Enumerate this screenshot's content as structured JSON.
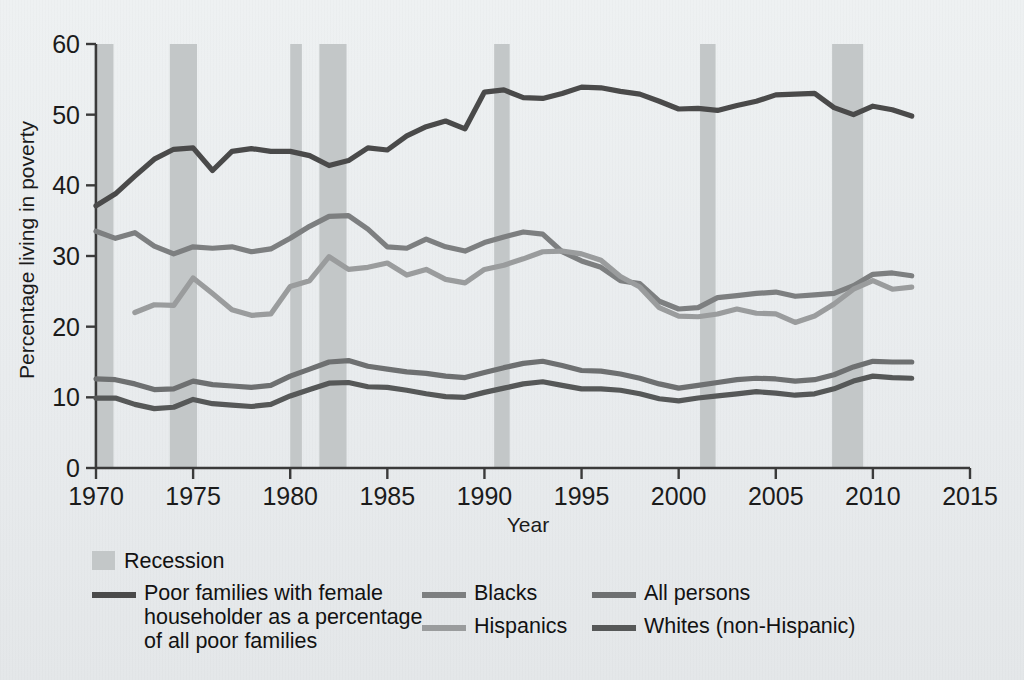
{
  "chart_data": {
    "type": "line",
    "title": "",
    "xlabel": "Year",
    "ylabel": "Percentage living in poverty",
    "xlim": [
      1970,
      2015
    ],
    "ylim": [
      0,
      60
    ],
    "xticks": [
      "1970",
      "1975",
      "1980",
      "1985",
      "1990",
      "1995",
      "2000",
      "2005",
      "2010",
      "2015"
    ],
    "yticks": [
      "0",
      "10",
      "20",
      "30",
      "40",
      "50",
      "60"
    ],
    "grid": false,
    "legend_position": "below-plot",
    "x": [
      1970,
      1971,
      1972,
      1973,
      1974,
      1975,
      1976,
      1977,
      1978,
      1979,
      1980,
      1981,
      1982,
      1983,
      1984,
      1985,
      1986,
      1987,
      1988,
      1989,
      1990,
      1991,
      1992,
      1993,
      1994,
      1995,
      1996,
      1997,
      1998,
      1999,
      2000,
      2001,
      2002,
      2003,
      2004,
      2005,
      2006,
      2007,
      2008,
      2009,
      2010,
      2011,
      2012
    ],
    "series": [
      {
        "name": "Poor families with female householder as a percentage of all poor families",
        "color": "#4a4a4a",
        "values": [
          37.1,
          38.8,
          41.3,
          43.7,
          45.1,
          45.3,
          42.1,
          44.8,
          45.2,
          44.8,
          44.8,
          44.2,
          42.8,
          43.5,
          45.3,
          45.0,
          47.0,
          48.3,
          49.1,
          48.0,
          53.2,
          53.5,
          52.4,
          52.3,
          53.0,
          53.9,
          53.8,
          53.3,
          52.9,
          51.9,
          50.8,
          50.9,
          50.6,
          51.3,
          51.9,
          52.8,
          52.9,
          53.0,
          51.0,
          50.0,
          51.2,
          50.7,
          49.8
        ]
      },
      {
        "name": "Blacks",
        "color": "#7d7f80",
        "values": [
          33.5,
          32.5,
          33.3,
          31.4,
          30.3,
          31.3,
          31.1,
          31.3,
          30.6,
          31.0,
          32.5,
          34.2,
          35.6,
          35.7,
          33.8,
          31.3,
          31.1,
          32.4,
          31.3,
          30.7,
          31.9,
          32.7,
          33.4,
          33.1,
          30.6,
          29.3,
          28.4,
          26.5,
          26.1,
          23.6,
          22.5,
          22.7,
          24.1,
          24.4,
          24.7,
          24.9,
          24.3,
          24.5,
          24.7,
          25.8,
          27.4,
          27.6,
          27.2
        ]
      },
      {
        "name": "Hispanics",
        "color": "#9a9c9d",
        "values": [
          null,
          null,
          22.0,
          23.1,
          23.0,
          26.9,
          24.7,
          22.4,
          21.6,
          21.8,
          25.7,
          26.5,
          29.9,
          28.1,
          28.4,
          29.0,
          27.3,
          28.1,
          26.7,
          26.2,
          28.1,
          28.7,
          29.6,
          30.6,
          30.7,
          30.3,
          29.4,
          27.1,
          25.6,
          22.7,
          21.5,
          21.4,
          21.8,
          22.5,
          21.9,
          21.8,
          20.6,
          21.5,
          23.2,
          25.3,
          26.5,
          25.3,
          25.6
        ]
      },
      {
        "name": "All persons",
        "color": "#6e7071",
        "values": [
          12.6,
          12.5,
          11.9,
          11.1,
          11.2,
          12.3,
          11.8,
          11.6,
          11.4,
          11.7,
          13.0,
          14.0,
          15.0,
          15.2,
          14.4,
          14.0,
          13.6,
          13.4,
          13.0,
          12.8,
          13.5,
          14.2,
          14.8,
          15.1,
          14.5,
          13.8,
          13.7,
          13.3,
          12.7,
          11.9,
          11.3,
          11.7,
          12.1,
          12.5,
          12.7,
          12.6,
          12.3,
          12.5,
          13.2,
          14.3,
          15.1,
          15.0,
          15.0
        ]
      },
      {
        "name": "Whites (non-Hispanic)",
        "color": "#565858",
        "values": [
          9.9,
          9.9,
          9.0,
          8.4,
          8.6,
          9.7,
          9.1,
          8.9,
          8.7,
          9.0,
          10.2,
          11.1,
          12.0,
          12.1,
          11.5,
          11.4,
          11.0,
          10.5,
          10.1,
          10.0,
          10.7,
          11.3,
          11.9,
          12.2,
          11.7,
          11.2,
          11.2,
          11.0,
          10.5,
          9.8,
          9.5,
          9.9,
          10.2,
          10.5,
          10.8,
          10.6,
          10.3,
          10.5,
          11.2,
          12.3,
          13.0,
          12.8,
          12.7
        ]
      }
    ],
    "recessions": [
      {
        "start": 1969.9,
        "end": 1970.9
      },
      {
        "start": 1973.8,
        "end": 1975.2
      },
      {
        "start": 1980.0,
        "end": 1980.6
      },
      {
        "start": 1981.5,
        "end": 1982.9
      },
      {
        "start": 1990.5,
        "end": 1991.3
      },
      {
        "start": 2001.1,
        "end": 2001.9
      },
      {
        "start": 2007.9,
        "end": 2009.5
      }
    ]
  },
  "legend": {
    "recession_label": "Recession",
    "entries": [
      {
        "label": "Poor families with female householder as a percentage of all poor families",
        "color": "#4a4a4a"
      },
      {
        "label": "Blacks",
        "color": "#7d7f80"
      },
      {
        "label": "Hispanics",
        "color": "#9a9c9d"
      },
      {
        "label": "All persons",
        "color": "#6e7071"
      },
      {
        "label": "Whites (non-Hispanic)",
        "color": "#565858"
      }
    ],
    "line1_text": "Poor families with female",
    "line2_text": "householder as a percentage",
    "line3_text": "of all poor families"
  },
  "axes": {
    "y_title": "Percentage living in poverty",
    "x_title": "Year"
  }
}
